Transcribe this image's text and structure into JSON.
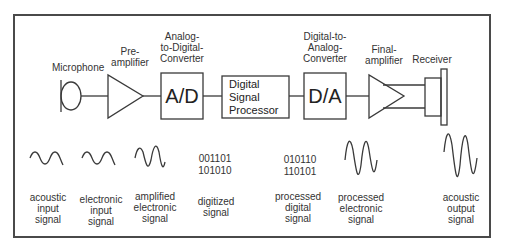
{
  "diagram": {
    "components": [
      {
        "id": "microphone",
        "label": "Microphone"
      },
      {
        "id": "pre_amplifier",
        "label": "Pre-\namplifier"
      },
      {
        "id": "adc",
        "label": "Analog-\nto-Digital-\nConverter",
        "box_text": "A/D"
      },
      {
        "id": "dsp",
        "label": "",
        "box_text": "Digital\nSignal\nProcessor"
      },
      {
        "id": "dac",
        "label": "Digital-to-\nAnalog-\nConverter",
        "box_text": "D/A"
      },
      {
        "id": "final_amplifier",
        "label": "Final-\namplifier"
      },
      {
        "id": "receiver",
        "label": "Receiver"
      }
    ],
    "signals": [
      {
        "id": "acoustic_input",
        "label": "acoustic\ninput\nsignal",
        "kind": "wave-small"
      },
      {
        "id": "electronic_input",
        "label": "electronic\ninput\nsignal",
        "kind": "wave-small"
      },
      {
        "id": "amplified_electronic",
        "label": "amplified\nelectronic\nsignal",
        "kind": "wave-medium"
      },
      {
        "id": "digitized",
        "label": "digitized\nsignal",
        "binary": "001101\n101010"
      },
      {
        "id": "processed_digital",
        "label": "processed\ndigital\nsignal",
        "binary": "010110\n110101"
      },
      {
        "id": "processed_electronic",
        "label": "processed\nelectronic\nsignal",
        "kind": "wave-large"
      },
      {
        "id": "acoustic_output",
        "label": "acoustic\noutput\nsignal",
        "kind": "wave-large"
      }
    ],
    "colors": {
      "line": "#3a3a3a",
      "frame": "#4a4a4a",
      "text": "#333333"
    }
  }
}
